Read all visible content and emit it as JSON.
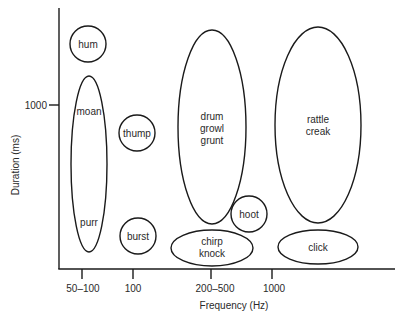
{
  "diagram": {
    "type": "sound-category-map",
    "x_axis": {
      "label": "Frequency (Hz)",
      "ticks": [
        {
          "label": "50–100",
          "x": 82
        },
        {
          "label": "100",
          "x": 133
        },
        {
          "label": "200–500",
          "x": 211
        },
        {
          "label": "1000",
          "x": 272
        }
      ]
    },
    "y_axis": {
      "label": "Duration (ms)",
      "ticks": [
        {
          "label": "1000",
          "y": 105
        }
      ]
    },
    "regions": [
      {
        "id": "hum",
        "labels": [
          "hum"
        ],
        "shape": "circle",
        "cx": 88,
        "cy": 44,
        "rx": 18,
        "ry": 18
      },
      {
        "id": "moan-purr",
        "labels": [
          "moan",
          "purr"
        ],
        "shape": "ellipse",
        "cx": 89,
        "cy": 164,
        "rx": 18,
        "ry": 88
      },
      {
        "id": "thump",
        "labels": [
          "thump"
        ],
        "shape": "circle",
        "cx": 137,
        "cy": 133,
        "rx": 18,
        "ry": 18
      },
      {
        "id": "burst",
        "labels": [
          "burst"
        ],
        "shape": "circle",
        "cx": 138,
        "cy": 236,
        "rx": 18,
        "ry": 18
      },
      {
        "id": "drum-growl-grunt",
        "labels": [
          "drum",
          "growl",
          "grunt"
        ],
        "shape": "ellipse",
        "cx": 212,
        "cy": 127,
        "rx": 34,
        "ry": 97
      },
      {
        "id": "rattle-creak",
        "labels": [
          "rattle",
          "creak"
        ],
        "shape": "ellipse",
        "cx": 318,
        "cy": 125,
        "rx": 43,
        "ry": 98
      },
      {
        "id": "hoot",
        "labels": [
          "hoot"
        ],
        "shape": "circle",
        "cx": 249,
        "cy": 214,
        "rx": 18,
        "ry": 18
      },
      {
        "id": "chirp-knock",
        "labels": [
          "chirp",
          "knock"
        ],
        "shape": "ellipse",
        "cx": 212,
        "cy": 248,
        "rx": 41,
        "ry": 18
      },
      {
        "id": "click",
        "labels": [
          "click"
        ],
        "shape": "ellipse",
        "cx": 318,
        "cy": 247,
        "rx": 40,
        "ry": 17
      }
    ]
  }
}
